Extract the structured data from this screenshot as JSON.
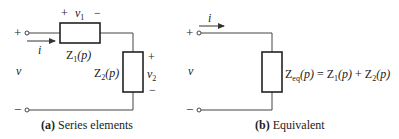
{
  "figure": {
    "panel_a": {
      "caption_tag": "(a)",
      "caption_text": "Series elements",
      "terminal_top_sign": "+",
      "terminal_bottom_sign": "−",
      "voltage_label": "v",
      "current_label": "i",
      "element1": {
        "name": "Z",
        "sub": "1",
        "arg": "(p)",
        "voltage_plus": "+",
        "voltage_label": "v",
        "voltage_sub": "1",
        "voltage_minus": "−"
      },
      "element2": {
        "name": "Z",
        "sub": "2",
        "arg": "(p)",
        "voltage_plus": "+",
        "voltage_label": "v",
        "voltage_sub": "2",
        "voltage_minus": "−"
      }
    },
    "panel_b": {
      "caption_tag": "(b)",
      "caption_text": "Equivalent",
      "terminal_top_sign": "+",
      "terminal_bottom_sign": "−",
      "voltage_label": "v",
      "current_label": "i",
      "equation": {
        "lhs_name": "Z",
        "lhs_sub": "eq",
        "lhs_arg": "(p)",
        "equals": " = ",
        "t1_name": "Z",
        "t1_sub": "1",
        "t1_arg": "(p)",
        "plus": " + ",
        "t2_name": "Z",
        "t2_sub": "2",
        "t2_arg": "(p)"
      }
    }
  }
}
